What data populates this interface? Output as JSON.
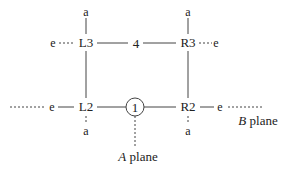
{
  "diagram": {
    "nodes": {
      "L3": "L3",
      "R3": "R3",
      "L2": "L2",
      "R2": "R2",
      "four": "4",
      "one": "1"
    },
    "terminals": {
      "a_top_left": "a",
      "a_top_right": "a",
      "a_bottom_left": "a",
      "a_bottom_right": "a",
      "e_left_top": "e",
      "e_right_top": "e",
      "e_left_bottom": "e",
      "e_right_bottom": "e"
    },
    "planes": {
      "a_plane_letter": "A",
      "a_plane_word": " plane",
      "b_plane_letter": "B",
      "b_plane_word": " plane"
    },
    "colors": {
      "line": "#444444",
      "text": "#222222",
      "background": "#ffffff"
    }
  }
}
